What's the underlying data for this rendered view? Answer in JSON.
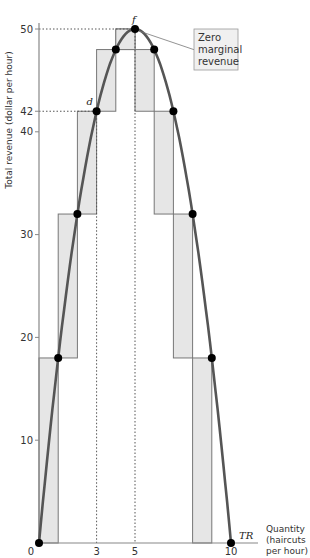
{
  "chart_data": {
    "type": "line",
    "title": "",
    "xlabel": "Quantity (haircuts per hour)",
    "xlabel_lines": [
      "Quantity",
      "(haircuts",
      "per hour)"
    ],
    "ylabel": "Total revenue (dollar per hour)",
    "xlim": [
      0,
      10
    ],
    "ylim": [
      0,
      50
    ],
    "x_ticks": [
      0,
      3,
      5,
      10
    ],
    "x_tick_labels": [
      "0",
      "3",
      "5",
      "10"
    ],
    "y_ticks": [
      10,
      20,
      30,
      40,
      42,
      50
    ],
    "y_tick_labels": [
      "10",
      "20",
      "30",
      "40",
      "42",
      "50"
    ],
    "grid": false,
    "series": [
      {
        "name": "TR",
        "x": [
          0,
          1,
          2,
          3,
          4,
          5,
          6,
          7,
          8,
          9,
          10
        ],
        "values": [
          0,
          18,
          32,
          42,
          48,
          50,
          48,
          42,
          32,
          18,
          0
        ]
      }
    ],
    "marginal_revenue_bars": [
      {
        "from_q": 0,
        "to_q": 1,
        "tr_from": 0,
        "tr_to": 18
      },
      {
        "from_q": 1,
        "to_q": 2,
        "tr_from": 18,
        "tr_to": 32
      },
      {
        "from_q": 2,
        "to_q": 3,
        "tr_from": 32,
        "tr_to": 42
      },
      {
        "from_q": 3,
        "to_q": 4,
        "tr_from": 42,
        "tr_to": 48
      },
      {
        "from_q": 4,
        "to_q": 5,
        "tr_from": 48,
        "tr_to": 50
      },
      {
        "from_q": 5,
        "to_q": 6,
        "tr_from": 50,
        "tr_to": 48
      },
      {
        "from_q": 6,
        "to_q": 7,
        "tr_from": 48,
        "tr_to": 42
      },
      {
        "from_q": 7,
        "to_q": 8,
        "tr_from": 42,
        "tr_to": 32
      },
      {
        "from_q": 8,
        "to_q": 9,
        "tr_from": 32,
        "tr_to": 18
      },
      {
        "from_q": 9,
        "to_q": 10,
        "tr_from": 18,
        "tr_to": 0
      }
    ],
    "annotations": [
      {
        "label": "d",
        "x": 3,
        "y": 42
      },
      {
        "label": "f",
        "x": 5,
        "y": 50
      },
      {
        "label": "TR",
        "x": 10,
        "y": 0
      },
      {
        "label": "Zero marginal revenue",
        "lines": [
          "Zero",
          "marginal",
          "revenue"
        ],
        "x": 5,
        "y": 50
      }
    ],
    "reference_lines": [
      {
        "type": "vertical-dotted",
        "x": 3,
        "y_top": 42
      },
      {
        "type": "vertical-dotted",
        "x": 5,
        "y_top": 50
      },
      {
        "type": "horizontal-dotted",
        "y": 42,
        "x_right": 3
      },
      {
        "type": "horizontal-dotted",
        "y": 50,
        "x_right": 5
      }
    ]
  },
  "colors": {
    "curve": "#555555",
    "bar_fill": "#e6e6e6",
    "bar_stroke": "#777777",
    "axis": "#888888",
    "point": "#000000",
    "callout_fill": "#f0f0f0"
  }
}
